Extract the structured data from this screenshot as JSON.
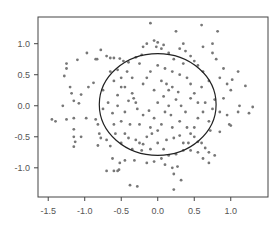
{
  "chart_data": {
    "type": "scatter",
    "title": "",
    "xlabel": "",
    "ylabel": "",
    "xlim": [
      -1.64,
      1.51
    ],
    "ylim": [
      -1.47,
      1.43
    ],
    "grid": false,
    "legend": null,
    "x_ticks": [
      -1.5,
      -1.0,
      -0.5,
      0.0,
      0.5,
      1.0
    ],
    "x_tick_labels": [
      "-1.5",
      "-1.0",
      "-0.5",
      "0.0",
      "0.5",
      "1.0"
    ],
    "y_ticks": [
      -1.0,
      -0.5,
      0.0,
      0.5,
      1.0
    ],
    "y_tick_labels": [
      "-1.0",
      "-0.5",
      "0.0",
      "0.5",
      "1.0"
    ],
    "overlay": {
      "shape": "ellipse",
      "center": [
        0.0,
        0.02
      ],
      "rx": 0.8,
      "ry": 0.82,
      "color": "#222222"
    },
    "point_color": "#777777",
    "series": [
      {
        "name": "points",
        "points": [
          [
            -1.45,
            -0.22
          ],
          [
            -1.4,
            -0.25
          ],
          [
            -1.3,
            0.0
          ],
          [
            -1.25,
            -0.22
          ],
          [
            -1.15,
            -0.2
          ],
          [
            -1.15,
            -0.38
          ],
          [
            -1.15,
            -0.5
          ],
          [
            -1.13,
            -0.58
          ],
          [
            -1.15,
            -0.66
          ],
          [
            -1.05,
            -0.5
          ],
          [
            -0.98,
            -0.2
          ],
          [
            -0.85,
            -0.22
          ],
          [
            -0.82,
            -0.3
          ],
          [
            -0.8,
            -0.45
          ],
          [
            -0.78,
            -0.52
          ],
          [
            -0.82,
            -0.64
          ],
          [
            -0.7,
            -1.05
          ],
          [
            -0.6,
            -1.05
          ],
          [
            -0.55,
            -1.05
          ],
          [
            -0.53,
            -1.03
          ],
          [
            -0.38,
            -1.28
          ],
          [
            -0.28,
            -1.3
          ],
          [
            -1.08,
            0.04
          ],
          [
            -1.2,
            0.3
          ],
          [
            -1.18,
            0.2
          ],
          [
            -1.28,
            0.48
          ],
          [
            -1.25,
            0.6
          ],
          [
            -1.25,
            0.68
          ],
          [
            -1.1,
            0.74
          ],
          [
            -1.15,
            0.08
          ],
          [
            -1.05,
            0.18
          ],
          [
            -0.95,
            0.3
          ],
          [
            -0.88,
            0.37
          ],
          [
            -0.97,
            0.85
          ],
          [
            -0.85,
            0.75
          ],
          [
            -0.83,
            0.75
          ],
          [
            -0.78,
            0.9
          ],
          [
            -0.7,
            0.8
          ],
          [
            -0.65,
            0.77
          ],
          [
            -0.6,
            0.77
          ],
          [
            -0.52,
            0.76
          ],
          [
            -0.47,
            0.72
          ],
          [
            -0.4,
            0.7
          ],
          [
            -0.55,
            0.58
          ],
          [
            -0.65,
            0.55
          ],
          [
            -0.6,
            0.4
          ],
          [
            -0.75,
            0.25
          ],
          [
            -0.68,
            0.05
          ],
          [
            -0.55,
            0.17
          ],
          [
            -0.45,
            0.3
          ],
          [
            -0.4,
            0.08
          ],
          [
            -0.35,
            0.2
          ],
          [
            -0.33,
            0.12
          ],
          [
            -0.3,
            0.05
          ],
          [
            -0.28,
            -0.05
          ],
          [
            -0.45,
            -0.1
          ],
          [
            -0.5,
            -0.25
          ],
          [
            -0.6,
            -0.3
          ],
          [
            -0.58,
            -0.45
          ],
          [
            -0.45,
            -0.45
          ],
          [
            -0.4,
            -0.52
          ],
          [
            -0.3,
            -0.55
          ],
          [
            -0.25,
            -0.6
          ],
          [
            -0.2,
            -0.62
          ],
          [
            -0.22,
            -0.72
          ],
          [
            -0.35,
            -0.7
          ],
          [
            -0.15,
            -0.5
          ],
          [
            -0.1,
            -0.35
          ],
          [
            0.0,
            -0.4
          ],
          [
            0.05,
            -0.3
          ],
          [
            -0.05,
            -0.2
          ],
          [
            -0.12,
            -0.08
          ],
          [
            0.0,
            0.05
          ],
          [
            0.08,
            0.15
          ],
          [
            0.15,
            0.25
          ],
          [
            0.2,
            0.3
          ],
          [
            0.25,
            0.1
          ],
          [
            0.32,
            0.0
          ],
          [
            0.38,
            -0.1
          ],
          [
            0.3,
            -0.25
          ],
          [
            0.4,
            -0.35
          ],
          [
            0.45,
            -0.45
          ],
          [
            0.5,
            -0.5
          ],
          [
            0.55,
            -0.58
          ],
          [
            0.6,
            -0.6
          ],
          [
            0.65,
            -0.68
          ],
          [
            0.7,
            -0.75
          ],
          [
            0.55,
            -0.75
          ],
          [
            0.45,
            -0.72
          ],
          [
            0.35,
            -0.72
          ],
          [
            0.25,
            -0.78
          ],
          [
            0.15,
            -0.8
          ],
          [
            0.05,
            -0.85
          ],
          [
            -0.05,
            -0.9
          ],
          [
            -0.15,
            -0.92
          ],
          [
            0.1,
            -0.95
          ],
          [
            0.2,
            -1.0
          ],
          [
            0.22,
            -1.1
          ],
          [
            0.27,
            -0.98
          ],
          [
            0.32,
            -1.2
          ],
          [
            0.22,
            -1.35
          ],
          [
            0.62,
            -0.85
          ],
          [
            0.7,
            -0.92
          ],
          [
            0.78,
            -0.8
          ],
          [
            0.85,
            -0.42
          ],
          [
            0.98,
            -0.3
          ],
          [
            1.0,
            -0.32
          ],
          [
            1.3,
            -0.02
          ],
          [
            1.25,
            -0.12
          ],
          [
            1.1,
            -0.1
          ],
          [
            0.95,
            -0.15
          ],
          [
            0.85,
            -0.1
          ],
          [
            0.75,
            -0.05
          ],
          [
            0.78,
            0.1
          ],
          [
            0.9,
            0.12
          ],
          [
            1.0,
            0.25
          ],
          [
            1.12,
            0.0
          ],
          [
            1.2,
            0.32
          ],
          [
            1.1,
            0.55
          ],
          [
            1.02,
            0.42
          ],
          [
            0.95,
            0.35
          ],
          [
            0.85,
            0.45
          ],
          [
            0.9,
            0.6
          ],
          [
            0.8,
            0.75
          ],
          [
            0.75,
            0.85
          ],
          [
            0.62,
            0.55
          ],
          [
            0.55,
            0.65
          ],
          [
            0.5,
            0.72
          ],
          [
            0.45,
            0.8
          ],
          [
            0.38,
            0.88
          ],
          [
            0.3,
            0.92
          ],
          [
            0.35,
            1.0
          ],
          [
            0.25,
            1.2
          ],
          [
            0.15,
            0.85
          ],
          [
            0.08,
            0.98
          ],
          [
            0.05,
            0.92
          ],
          [
            0.0,
            1.02
          ],
          [
            -0.05,
            1.05
          ],
          [
            -0.02,
            0.95
          ],
          [
            -0.15,
            1.0
          ],
          [
            -0.2,
            0.95
          ],
          [
            -0.22,
            0.82
          ],
          [
            -0.25,
            0.68
          ],
          [
            -0.3,
            0.78
          ],
          [
            -0.1,
            1.33
          ],
          [
            0.6,
            1.3
          ],
          [
            0.82,
            1.2
          ],
          [
            0.75,
            1.0
          ],
          [
            0.62,
            0.95
          ],
          [
            0.7,
            0.4
          ],
          [
            0.6,
            0.3
          ],
          [
            0.5,
            0.2
          ],
          [
            0.45,
            0.35
          ],
          [
            0.4,
            0.45
          ],
          [
            0.3,
            0.5
          ],
          [
            0.2,
            0.55
          ],
          [
            0.1,
            0.6
          ],
          [
            0.0,
            0.65
          ],
          [
            -0.1,
            0.55
          ],
          [
            -0.15,
            0.45
          ],
          [
            -0.2,
            0.35
          ],
          [
            0.05,
            0.4
          ],
          [
            0.12,
            0.35
          ],
          [
            -0.05,
            0.25
          ],
          [
            0.1,
            -0.1
          ],
          [
            0.18,
            -0.15
          ],
          [
            0.2,
            -0.35
          ],
          [
            0.12,
            -0.55
          ],
          [
            0.22,
            -0.52
          ],
          [
            0.3,
            -0.48
          ],
          [
            0.35,
            -0.6
          ],
          [
            0.42,
            -0.6
          ],
          [
            0.5,
            -0.35
          ],
          [
            0.55,
            -0.2
          ],
          [
            0.62,
            -0.1
          ],
          [
            0.65,
            0.05
          ],
          [
            0.55,
            0.05
          ],
          [
            0.45,
            0.12
          ],
          [
            0.7,
            -0.25
          ],
          [
            0.72,
            -0.4
          ],
          [
            -0.65,
            -0.65
          ],
          [
            -0.7,
            -0.55
          ],
          [
            -0.5,
            -0.6
          ],
          [
            -0.38,
            -0.3
          ],
          [
            -0.25,
            -0.3
          ],
          [
            -0.62,
            -0.12
          ],
          [
            -0.55,
            0.0
          ],
          [
            -0.75,
            -0.05
          ],
          [
            -0.2,
            -0.15
          ],
          [
            0.0,
            -0.6
          ],
          [
            -0.1,
            -0.7
          ],
          [
            0.08,
            -0.7
          ],
          [
            -0.32,
            -0.88
          ],
          [
            -0.45,
            -0.88
          ],
          [
            -0.52,
            -0.92
          ],
          [
            -0.62,
            -0.85
          ],
          [
            -0.35,
            0.45
          ],
          [
            -0.42,
            0.55
          ],
          [
            -0.5,
            0.45
          ],
          [
            -0.5,
            0.3
          ],
          [
            0.22,
            0.75
          ],
          [
            0.35,
            0.68
          ],
          [
            0.15,
            0.0
          ],
          [
            -0.08,
            -0.45
          ],
          [
            0.28,
            0.22
          ]
        ]
      }
    ]
  }
}
